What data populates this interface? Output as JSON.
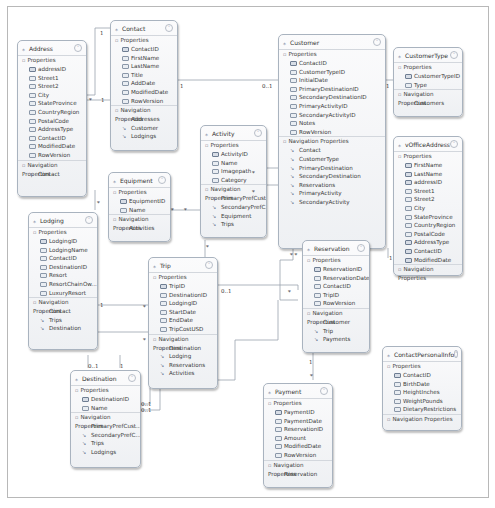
{
  "entities": {
    "contact": {
      "title": "Contact",
      "props": [
        "ContactID",
        "FirstName",
        "LastName",
        "Title",
        "AddDate",
        "ModifiedDate",
        "RowVersion"
      ],
      "keys": [
        0
      ],
      "nav": [
        "Addresses",
        "Customer",
        "Lodgings"
      ]
    },
    "address": {
      "title": "Address",
      "props": [
        "addressID",
        "Street1",
        "Street2",
        "City",
        "StateProvince",
        "CountryRegion",
        "PostalCode",
        "AddressType",
        "ContactID",
        "ModifiedDate",
        "RowVersion"
      ],
      "keys": [
        0
      ],
      "nav": [
        "Contact"
      ]
    },
    "customer": {
      "title": "Customer",
      "props": [
        "ContactID",
        "CustomerTypeID",
        "InitialDate",
        "PrimaryDestinationID",
        "SecondaryDestinationID",
        "PrimaryActivityID",
        "SecondaryActivityID",
        "Notes",
        "RowVersion"
      ],
      "keys": [
        0
      ],
      "nav": [
        "Contact",
        "CustomerType",
        "PrimaryDestination",
        "SecondaryDestination",
        "Reservations",
        "PrimaryActivity",
        "SecondaryActivity"
      ]
    },
    "customertype": {
      "title": "CustomerType",
      "props": [
        "CustomerTypeID",
        "Type"
      ],
      "keys": [
        0
      ],
      "nav": [
        "Customers"
      ]
    },
    "vofficeaddress": {
      "title": "vOfficeAddress",
      "props": [
        "FirstName",
        "LastName",
        "addressID",
        "Street1",
        "Street2",
        "City",
        "StateProvince",
        "CountryRegion",
        "PostalCode",
        "AddressType",
        "ContactID",
        "ModifiedDate"
      ],
      "keys": [
        0,
        1,
        2,
        9,
        10,
        11
      ],
      "nav": []
    },
    "activity": {
      "title": "Activity",
      "props": [
        "ActivityID",
        "Name",
        "Imagepath",
        "Category"
      ],
      "keys": [
        0
      ],
      "nav": [
        "PrimaryPrefCust...",
        "SecondaryPrefC...",
        "Equipment",
        "Trips"
      ]
    },
    "equipment": {
      "title": "Equipment",
      "props": [
        "EquipmentID",
        "Name"
      ],
      "keys": [
        0
      ],
      "nav": [
        "Activities"
      ]
    },
    "lodging": {
      "title": "Lodging",
      "props": [
        "LodgingID",
        "LodgingName",
        "ContactID",
        "DestinationID",
        "Resort",
        "ResortChainOw...",
        "LuxuryResort"
      ],
      "keys": [
        0
      ],
      "nav": [
        "Contact",
        "Trips",
        "Destination"
      ]
    },
    "trip": {
      "title": "Trip",
      "props": [
        "TripID",
        "DestinationID",
        "LodgingID",
        "StartDate",
        "EndDate",
        "TripCostUSD"
      ],
      "keys": [
        0
      ],
      "nav": [
        "Destination",
        "Lodging",
        "Reservations",
        "Activities"
      ]
    },
    "reservation": {
      "title": "Reservation",
      "props": [
        "ReservationID",
        "ReservationDate",
        "ContactID",
        "TripID",
        "RowVersion"
      ],
      "keys": [
        0
      ],
      "nav": [
        "Customer",
        "Trip",
        "Payments"
      ]
    },
    "destination": {
      "title": "Destination",
      "props": [
        "DestinationID",
        "Name"
      ],
      "keys": [
        0
      ],
      "nav": [
        "PrimaryPrefCust...",
        "SecondaryPrefC...",
        "Trips",
        "Lodgings"
      ]
    },
    "payment": {
      "title": "Payment",
      "props": [
        "PaymentID",
        "PaymentDate",
        "ReservationID",
        "Amount",
        "ModifiedDate",
        "RowVersion"
      ],
      "keys": [
        0
      ],
      "nav": [
        "Reservation"
      ]
    },
    "contactpersonalinfo": {
      "title": "ContactPersonalInfo",
      "props": [
        "ContactID",
        "BirthDate",
        "HeightInches",
        "WeightPounds",
        "DietaryRestrictions"
      ],
      "keys": [
        0
      ],
      "nav": []
    }
  },
  "labels": {
    "properties": "Properties",
    "navigation": "Navigation Properties"
  },
  "multiplicities": [
    {
      "text": "1",
      "x": 100,
      "y": 30
    },
    {
      "text": "*",
      "x": 89,
      "y": 97
    },
    {
      "text": "1",
      "x": 101,
      "y": 97
    },
    {
      "text": "1",
      "x": 180,
      "y": 83
    },
    {
      "text": "0..1",
      "x": 262,
      "y": 83
    },
    {
      "text": "1",
      "x": 386,
      "y": 83
    },
    {
      "text": "*",
      "x": 252,
      "y": 170
    },
    {
      "text": "*",
      "x": 252,
      "y": 189
    },
    {
      "text": "*",
      "x": 171,
      "y": 207
    },
    {
      "text": "*",
      "x": 184,
      "y": 207
    },
    {
      "text": "*",
      "x": 97,
      "y": 200
    },
    {
      "text": "1",
      "x": 100,
      "y": 302
    },
    {
      "text": "*",
      "x": 143,
      "y": 304
    },
    {
      "text": "*",
      "x": 143,
      "y": 337
    },
    {
      "text": "*",
      "x": 206,
      "y": 244
    },
    {
      "text": "0..1",
      "x": 221,
      "y": 288
    },
    {
      "text": "*",
      "x": 288,
      "y": 289
    },
    {
      "text": "* *",
      "x": 290,
      "y": 252
    },
    {
      "text": "1",
      "x": 389,
      "y": 255
    },
    {
      "text": "0..1",
      "x": 88,
      "y": 363
    },
    {
      "text": "1",
      "x": 120,
      "y": 363
    },
    {
      "text": "0..1",
      "x": 141,
      "y": 401
    },
    {
      "text": "0..1",
      "x": 141,
      "y": 407
    },
    {
      "text": "1",
      "x": 309,
      "y": 359
    },
    {
      "text": "*",
      "x": 310,
      "y": 373
    }
  ]
}
